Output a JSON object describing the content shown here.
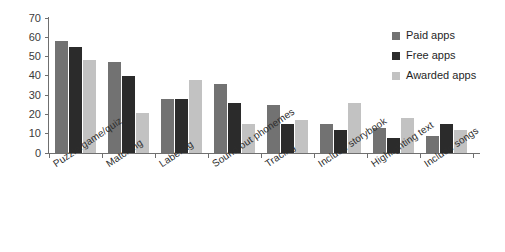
{
  "chart_data": {
    "type": "bar",
    "title": "",
    "subtitle": "",
    "xlabel": "",
    "ylabel": "",
    "ylim": [
      0,
      70
    ],
    "y_ticks": [
      0,
      10,
      20,
      30,
      40,
      50,
      60,
      70
    ],
    "grid": false,
    "legend_position": "right",
    "categories": [
      "Puzzle/game/quiz",
      "Matching",
      "Labeling",
      "Sound out phonemes",
      "Tracing",
      "Include storybook",
      "Highlighting text",
      "Include songs"
    ],
    "series": [
      {
        "name": "Paid apps",
        "color": "#727272",
        "values": [
          58,
          47,
          28,
          36,
          25,
          15,
          13,
          9
        ]
      },
      {
        "name": "Free apps",
        "color": "#2b2b2b",
        "values": [
          55,
          40,
          28,
          26,
          15,
          12,
          8,
          15
        ]
      },
      {
        "name": "Awarded apps",
        "color": "#c2c2c2",
        "values": [
          48,
          21,
          38,
          15,
          17,
          26,
          18,
          12
        ]
      }
    ]
  },
  "legend": {
    "items": [
      {
        "label": "Paid apps"
      },
      {
        "label": "Free apps"
      },
      {
        "label": "Awarded apps"
      }
    ]
  },
  "axis": {
    "y_tick_labels": [
      "70",
      "60",
      "50",
      "40",
      "30",
      "20",
      "10",
      "0"
    ]
  }
}
